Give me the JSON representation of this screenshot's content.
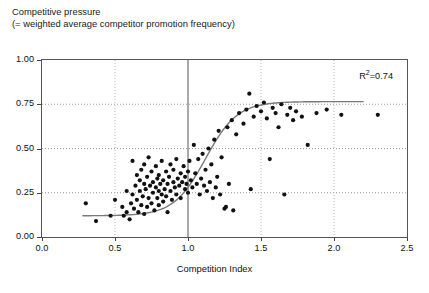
{
  "title": {
    "line1": "Competitive pressure",
    "line2": "(= weighted average competitor promotion frequency)"
  },
  "annotations": {
    "r2_prefix": "R",
    "r2_sup": "2",
    "r2_value": "=0.74"
  },
  "chart_data": {
    "type": "scatter",
    "title": "Competitive pressure (= weighted average competitor promotion frequency)",
    "xlabel": "Competition Index",
    "ylabel": "Competitive pressure",
    "xlim": [
      0.0,
      2.5
    ],
    "ylim": [
      0.0,
      1.0
    ],
    "xticks": [
      "0.0",
      "0.5",
      "1.0",
      "1.5",
      "2.0",
      "2.5"
    ],
    "xtick_values": [
      0.0,
      0.5,
      1.0,
      1.5,
      2.0,
      2.5
    ],
    "yticks": [
      "0.00",
      "0.25",
      "0.50",
      "0.75",
      "1.00"
    ],
    "ytick_values": [
      0.0,
      0.25,
      0.5,
      0.75,
      1.0
    ],
    "grid": "dotted-gray",
    "emphasis_gridline_x": 1.0,
    "legend": "none",
    "r_squared": 0.74,
    "marker": {
      "shape": "circle",
      "color": "#111111",
      "size_px": 4.2
    },
    "fit_curve": {
      "name": "logistic fit",
      "color": "#7a7a7a",
      "width_px": 1.4,
      "lower_asymptote": 0.12,
      "upper_asymptote": 0.765,
      "midpoint_x": 1.12,
      "steepness": 4.6,
      "x_start": 0.28,
      "x_end": 2.2
    },
    "points": [
      [
        0.3,
        0.19
      ],
      [
        0.37,
        0.09
      ],
      [
        0.47,
        0.12
      ],
      [
        0.5,
        0.21
      ],
      [
        0.55,
        0.17
      ],
      [
        0.56,
        0.12
      ],
      [
        0.58,
        0.14
      ],
      [
        0.58,
        0.26
      ],
      [
        0.6,
        0.1
      ],
      [
        0.61,
        0.19
      ],
      [
        0.62,
        0.24
      ],
      [
        0.62,
        0.43
      ],
      [
        0.63,
        0.16
      ],
      [
        0.64,
        0.29
      ],
      [
        0.65,
        0.21
      ],
      [
        0.65,
        0.35
      ],
      [
        0.66,
        0.14
      ],
      [
        0.67,
        0.26
      ],
      [
        0.67,
        0.32
      ],
      [
        0.68,
        0.18
      ],
      [
        0.68,
        0.38
      ],
      [
        0.69,
        0.23
      ],
      [
        0.7,
        0.13
      ],
      [
        0.7,
        0.3
      ],
      [
        0.7,
        0.41
      ],
      [
        0.71,
        0.27
      ],
      [
        0.72,
        0.17
      ],
      [
        0.72,
        0.34
      ],
      [
        0.73,
        0.22
      ],
      [
        0.73,
        0.45
      ],
      [
        0.74,
        0.29
      ],
      [
        0.75,
        0.19
      ],
      [
        0.75,
        0.37
      ],
      [
        0.76,
        0.25
      ],
      [
        0.76,
        0.31
      ],
      [
        0.77,
        0.15
      ],
      [
        0.78,
        0.28
      ],
      [
        0.78,
        0.4
      ],
      [
        0.79,
        0.22
      ],
      [
        0.79,
        0.33
      ],
      [
        0.8,
        0.18
      ],
      [
        0.8,
        0.26
      ],
      [
        0.8,
        0.35
      ],
      [
        0.81,
        0.3
      ],
      [
        0.82,
        0.24
      ],
      [
        0.82,
        0.43
      ],
      [
        0.83,
        0.2
      ],
      [
        0.83,
        0.32
      ],
      [
        0.84,
        0.27
      ],
      [
        0.85,
        0.37
      ],
      [
        0.85,
        0.23
      ],
      [
        0.86,
        0.3
      ],
      [
        0.86,
        0.14
      ],
      [
        0.87,
        0.34
      ],
      [
        0.88,
        0.26
      ],
      [
        0.88,
        0.41
      ],
      [
        0.89,
        0.21
      ],
      [
        0.9,
        0.31
      ],
      [
        0.9,
        0.38
      ],
      [
        0.91,
        0.28
      ],
      [
        0.92,
        0.24
      ],
      [
        0.92,
        0.44
      ],
      [
        0.93,
        0.33
      ],
      [
        0.94,
        0.29
      ],
      [
        0.95,
        0.36
      ],
      [
        0.95,
        0.22
      ],
      [
        0.96,
        0.31
      ],
      [
        0.97,
        0.4
      ],
      [
        0.98,
        0.27
      ],
      [
        0.98,
        0.34
      ],
      [
        0.99,
        0.3
      ],
      [
        1.0,
        0.37
      ],
      [
        1.0,
        0.25
      ],
      [
        1.01,
        0.43
      ],
      [
        1.02,
        0.32
      ],
      [
        1.03,
        0.28
      ],
      [
        1.04,
        0.52
      ],
      [
        1.05,
        0.36
      ],
      [
        1.06,
        0.3
      ],
      [
        1.07,
        0.44
      ],
      [
        1.08,
        0.24
      ],
      [
        1.09,
        0.33
      ],
      [
        1.1,
        0.47
      ],
      [
        1.11,
        0.29
      ],
      [
        1.12,
        0.38
      ],
      [
        1.13,
        0.26
      ],
      [
        1.14,
        0.5
      ],
      [
        1.15,
        0.31
      ],
      [
        1.16,
        0.41
      ],
      [
        1.17,
        0.22
      ],
      [
        1.18,
        0.55
      ],
      [
        1.19,
        0.28
      ],
      [
        1.2,
        0.34
      ],
      [
        1.21,
        0.6
      ],
      [
        1.22,
        0.24
      ],
      [
        1.23,
        0.45
      ],
      [
        1.25,
        0.16
      ],
      [
        1.26,
        0.17
      ],
      [
        1.27,
        0.62
      ],
      [
        1.28,
        0.3
      ],
      [
        1.3,
        0.66
      ],
      [
        1.31,
        0.15
      ],
      [
        1.33,
        0.58
      ],
      [
        1.35,
        0.7
      ],
      [
        1.38,
        0.64
      ],
      [
        1.4,
        0.72
      ],
      [
        1.42,
        0.81
      ],
      [
        1.43,
        0.27
      ],
      [
        1.45,
        0.68
      ],
      [
        1.47,
        0.74
      ],
      [
        1.5,
        0.71
      ],
      [
        1.52,
        0.76
      ],
      [
        1.54,
        0.67
      ],
      [
        1.56,
        0.44
      ],
      [
        1.58,
        0.73
      ],
      [
        1.6,
        0.7
      ],
      [
        1.62,
        0.62
      ],
      [
        1.64,
        0.75
      ],
      [
        1.66,
        0.24
      ],
      [
        1.68,
        0.69
      ],
      [
        1.7,
        0.73
      ],
      [
        1.72,
        0.66
      ],
      [
        1.74,
        0.71
      ],
      [
        1.78,
        0.68
      ],
      [
        1.82,
        0.52
      ],
      [
        1.88,
        0.7
      ],
      [
        1.95,
        0.72
      ],
      [
        2.05,
        0.69
      ],
      [
        2.3,
        0.69
      ]
    ]
  }
}
